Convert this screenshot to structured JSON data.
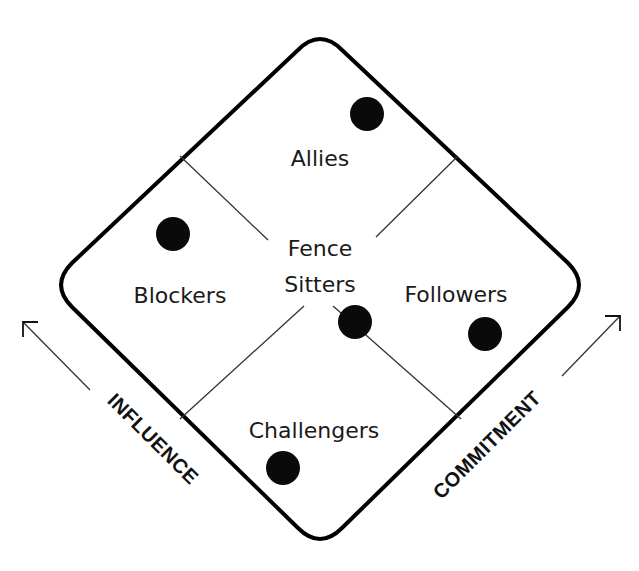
{
  "diagram": {
    "type": "stakeholder-diamond",
    "colors": {
      "outline": "#000000",
      "divider": "#333333",
      "dot": "#0a0a0a",
      "text": "#1a1a1a",
      "background": "#ffffff"
    },
    "quadrants": {
      "top": {
        "label": "Allies"
      },
      "left": {
        "label": "Blockers"
      },
      "center": {
        "line1": "Fence",
        "line2": "Sitters"
      },
      "right": {
        "label": "Followers"
      },
      "bottom": {
        "label": "Challengers"
      }
    },
    "axes": {
      "left": {
        "label": "INFLUENCE",
        "arrow": "up-left"
      },
      "right": {
        "label": "COMMITMENT",
        "arrow": "up-right"
      }
    },
    "markers": [
      {
        "region": "Allies",
        "x": 367,
        "y": 114
      },
      {
        "region": "Blockers",
        "x": 173,
        "y": 234
      },
      {
        "region": "Fence Sitters",
        "x": 355,
        "y": 322
      },
      {
        "region": "Followers",
        "x": 485,
        "y": 334
      },
      {
        "region": "Challengers",
        "x": 283,
        "y": 468
      }
    ]
  }
}
